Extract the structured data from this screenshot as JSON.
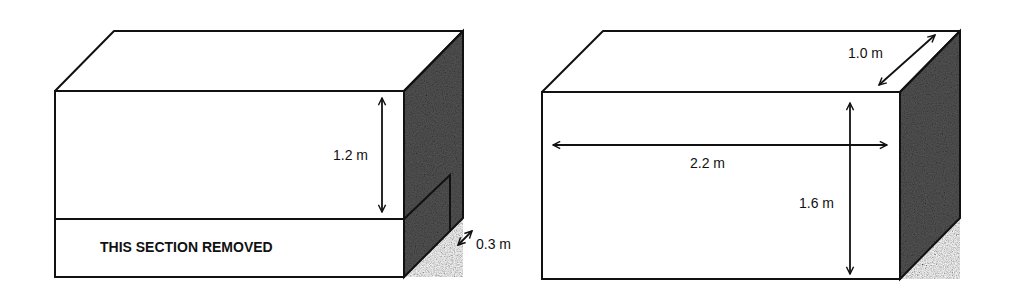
{
  "figure": {
    "left_box": {
      "height_label": "1.2 m",
      "removed_label": "THIS SECTION REMOVED",
      "thickness_label": "0.3 m"
    },
    "right_box": {
      "depth_label": "1.0 m",
      "width_label": "2.2 m",
      "height_label": "1.6 m"
    }
  },
  "colors": {
    "stroke": "#111111",
    "shade_dark": "#3a3a3a",
    "shade_light": "#8a8a8a",
    "background": "#ffffff"
  }
}
